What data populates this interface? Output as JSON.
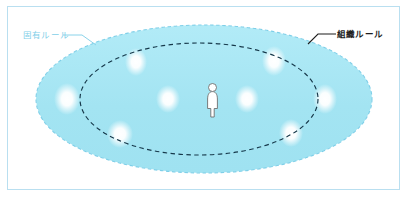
{
  "figure": {
    "frame": {
      "border_color": "#b9dff0",
      "background_color": "#ffffff"
    },
    "labels": {
      "inherent_rule": "固有ルール",
      "organization_rule": "組織ルール"
    },
    "icons": {
      "person": "person-pictogram",
      "leader_line_left": "leader-line-icon",
      "leader_line_right": "leader-line-icon"
    },
    "colors": {
      "fill_cyan": "#a5e6f2",
      "fill_cyan_light": "#b8ecf6",
      "outer_dash": "#7fcfe8",
      "inner_dash": "#16384a",
      "dot_white": "#ffffff",
      "label_light": "#7fcfe8",
      "label_dark": "#1d1d1d",
      "person_outline": "#6b6b6b"
    },
    "shapes": {
      "outer_ellipse": {
        "name": "固有ルール",
        "cx": 204,
        "cy": 99,
        "rx": 168,
        "ry": 74,
        "stroke": "dashed-light-blue",
        "fill": "#a5e6f2"
      },
      "inner_ellipse": {
        "name": "組織ルール",
        "cx": 199,
        "cy": 99,
        "rx": 119,
        "ry": 56,
        "stroke": "dashed-dark-navy",
        "fill": "none"
      }
    },
    "dots": [
      {
        "cx": 67,
        "cy": 99,
        "rx": 10,
        "ry": 13
      },
      {
        "cx": 136,
        "cy": 62,
        "rx": 8,
        "ry": 11
      },
      {
        "cx": 120,
        "cy": 134,
        "rx": 10,
        "ry": 11
      },
      {
        "cx": 168,
        "cy": 99,
        "rx": 9,
        "ry": 11
      },
      {
        "cx": 247,
        "cy": 99,
        "rx": 9,
        "ry": 11
      },
      {
        "cx": 274,
        "cy": 61,
        "rx": 9,
        "ry": 12
      },
      {
        "cx": 291,
        "cy": 133,
        "rx": 9,
        "ry": 11
      },
      {
        "cx": 325,
        "cy": 99,
        "rx": 9,
        "ry": 12
      }
    ],
    "person": {
      "x": 207,
      "y": 84,
      "width": 11,
      "height": 33
    }
  }
}
